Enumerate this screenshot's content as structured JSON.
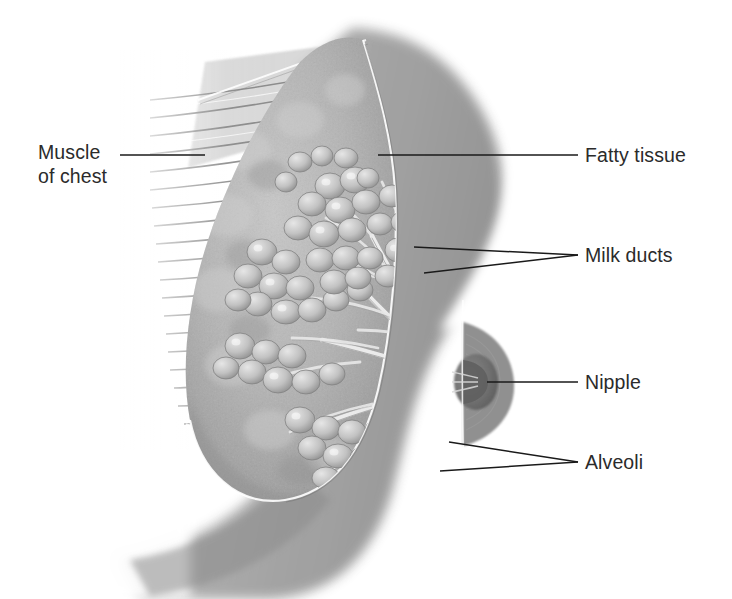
{
  "figure": {
    "style": "grayscale airbrush medical illustration",
    "background_color": "#ffffff",
    "label_color": "#2b2b2b",
    "leader_line_color": "#1a1a1a",
    "width": 732,
    "height": 599
  },
  "labels": [
    {
      "id": "muscle-of-chest",
      "line1": "Muscle",
      "line2": "of chest",
      "side": "left",
      "text_x": 38,
      "text_y1": 159,
      "text_y2": 183,
      "leader": [
        [
          120,
          155
        ],
        [
          205,
          155
        ]
      ]
    },
    {
      "id": "fatty-tissue",
      "line1": "Fatty tissue",
      "line2": "",
      "side": "right",
      "text_x": 585,
      "text_y1": 162,
      "text_y2": 0,
      "leader": [
        [
          378,
          155
        ],
        [
          578,
          155
        ]
      ]
    },
    {
      "id": "milk-ducts",
      "line1": "Milk ducts",
      "line2": "",
      "side": "right",
      "text_x": 585,
      "text_y1": 262,
      "text_y2": 0,
      "leader": [
        [
          414,
          247
        ],
        [
          578,
          255
        ]
      ],
      "leader2": [
        [
          424,
          273
        ],
        [
          578,
          255
        ]
      ]
    },
    {
      "id": "nipple",
      "line1": "Nipple",
      "line2": "",
      "side": "right",
      "text_x": 585,
      "text_y1": 389,
      "text_y2": 0,
      "leader": [
        [
          487,
          382
        ],
        [
          578,
          382
        ]
      ]
    },
    {
      "id": "alveoli",
      "line1": "Alveoli",
      "line2": "",
      "side": "right",
      "text_x": 585,
      "text_y1": 469,
      "text_y2": 0,
      "leader": [
        [
          449,
          442
        ],
        [
          578,
          462
        ]
      ],
      "leader2": [
        [
          440,
          471
        ],
        [
          578,
          462
        ]
      ]
    }
  ],
  "structures": {
    "chest_wall": "torso silhouette sweeping from upper right down to lower left",
    "pectoral_muscle": "horizontal striated muscle fibers fading left",
    "fatty_tissue": "speckled stroma filling the breast body",
    "lobules": "grape-like alveoli clusters on branching ducts",
    "ducts": "pale tubules converging toward the nipple",
    "nipple": "dark rounded protrusion at right of cut plane",
    "areola": "concentric shaded ring around the nipple"
  }
}
